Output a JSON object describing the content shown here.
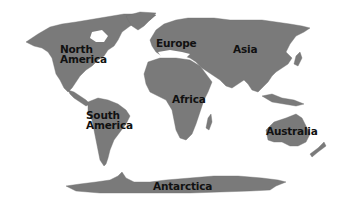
{
  "map": {
    "type": "world-continents",
    "land_color": "#7a7a7a",
    "water_color": "#ffffff",
    "label_color": "#111111",
    "labels": [
      {
        "id": "north-america",
        "lines": [
          "North",
          "America"
        ]
      },
      {
        "id": "europe",
        "lines": [
          "Europe"
        ]
      },
      {
        "id": "asia",
        "lines": [
          "Asia"
        ]
      },
      {
        "id": "africa",
        "lines": [
          "Africa"
        ]
      },
      {
        "id": "south-america",
        "lines": [
          "South",
          "America"
        ]
      },
      {
        "id": "australia",
        "lines": [
          "Australia"
        ]
      },
      {
        "id": "antarctica",
        "lines": [
          "Antarctica"
        ]
      }
    ]
  }
}
